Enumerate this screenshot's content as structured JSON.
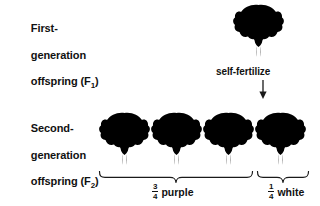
{
  "figure": {
    "background_color": "#ffffff",
    "width": 320,
    "height": 206
  },
  "rows": [
    {
      "id": "f1",
      "label_line1": "First-",
      "label_line2": "generation",
      "label_line3_prefix": "offspring (F",
      "label_line3_subscript": "1",
      "label_line3_suffix": ")",
      "flower_count": 1
    },
    {
      "id": "f2",
      "label_line1": "Second-",
      "label_line2": "generation",
      "label_line3_prefix": "offspring (F",
      "label_line3_subscript": "2",
      "label_line3_suffix": ")",
      "flower_count": 4
    }
  ],
  "process": {
    "label": "self-fertilize",
    "arrow_direction": "down",
    "arrow_icon": "arrow-down-icon"
  },
  "groups": [
    {
      "id": "purple",
      "numerator": "3",
      "denominator": "4",
      "word": "purple",
      "bracket_icon": "curly-brace-down-icon",
      "flower_count": 3
    },
    {
      "id": "white",
      "numerator": "1",
      "denominator": "4",
      "word": "white",
      "bracket_icon": "curly-brace-down-icon",
      "flower_count": 1
    }
  ],
  "flowers": {
    "f1": {
      "icon": "pea-flower-icon",
      "shade": "purple"
    },
    "f2": [
      {
        "icon": "pea-flower-icon",
        "shade": "purple"
      },
      {
        "icon": "pea-flower-icon",
        "shade": "purple"
      },
      {
        "icon": "pea-flower-icon",
        "shade": "purple"
      },
      {
        "icon": "pea-flower-icon",
        "shade": "white"
      }
    ]
  },
  "colors": {
    "text": "#111111",
    "line": "#1a1a1a",
    "flower_purple_dark": "#9e9e9e",
    "flower_purple_mid": "#c4c4c4",
    "flower_purple_light": "#dcdcdc",
    "flower_white_dark": "#e6e6e6",
    "flower_white_mid": "#f2f2f2",
    "flower_white_light": "#fafafa",
    "stem": "#cfcfcf"
  }
}
